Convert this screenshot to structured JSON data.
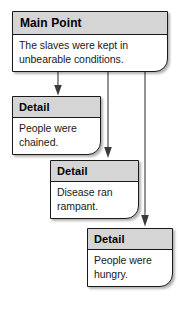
{
  "diagram": {
    "type": "flowchart",
    "colors": {
      "header_fill": "#d5d5d5",
      "body_fill": "#ffffff",
      "border": "#1a1a1a",
      "arrow": "#3a3a3a",
      "page_background": "#ffffff"
    },
    "nodes": [
      {
        "id": "main",
        "header": "Main Point",
        "body": "The slaves were kept in unbearable conditions."
      },
      {
        "id": "detail-1",
        "header": "Detail",
        "body": "People were chained."
      },
      {
        "id": "detail-2",
        "header": "Detail",
        "body": "Disease ran rampant."
      },
      {
        "id": "detail-3",
        "header": "Detail",
        "body": "People were hungry."
      }
    ],
    "connectors": [
      {
        "id": "main-to-detail-1",
        "from": "main",
        "to": "detail-1",
        "style": "arrow-down"
      },
      {
        "id": "main-to-detail-2",
        "from": "main",
        "to": "detail-2",
        "style": "arrow-down"
      },
      {
        "id": "main-to-detail-3",
        "from": "main",
        "to": "detail-3",
        "style": "arrow-down"
      }
    ]
  }
}
